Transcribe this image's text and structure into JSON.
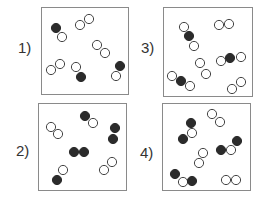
{
  "colors": {
    "dark_atom": "#2b2b2b",
    "light_atom_fill": "#ffffff",
    "light_atom_stroke": "#444444",
    "box_border": "#8a8a8a",
    "label": "#333333"
  },
  "atom_radius": 4.6,
  "panels": [
    {
      "label": "1)",
      "label_pos": [
        18,
        40
      ],
      "box": [
        41,
        7,
        88,
        88
      ],
      "atoms": [
        {
          "x": 56,
          "y": 28,
          "t": "dark"
        },
        {
          "x": 62,
          "y": 37,
          "t": "light"
        },
        {
          "x": 80,
          "y": 25,
          "t": "light"
        },
        {
          "x": 89,
          "y": 19,
          "t": "light"
        },
        {
          "x": 97,
          "y": 45,
          "t": "light"
        },
        {
          "x": 105,
          "y": 53,
          "t": "light"
        },
        {
          "x": 51,
          "y": 70,
          "t": "light"
        },
        {
          "x": 60,
          "y": 64,
          "t": "light"
        },
        {
          "x": 76,
          "y": 67,
          "t": "light"
        },
        {
          "x": 81,
          "y": 77,
          "t": "dark"
        },
        {
          "x": 120,
          "y": 66,
          "t": "dark"
        },
        {
          "x": 116,
          "y": 76,
          "t": "light"
        }
      ]
    },
    {
      "label": "2)",
      "label_pos": [
        16,
        143
      ],
      "box": [
        38,
        103,
        89,
        88
      ],
      "atoms": [
        {
          "x": 51,
          "y": 127,
          "t": "light"
        },
        {
          "x": 58,
          "y": 134,
          "t": "light"
        },
        {
          "x": 85,
          "y": 116,
          "t": "dark"
        },
        {
          "x": 93,
          "y": 123,
          "t": "light"
        },
        {
          "x": 115,
          "y": 128,
          "t": "dark"
        },
        {
          "x": 113,
          "y": 139,
          "t": "dark"
        },
        {
          "x": 74,
          "y": 152,
          "t": "dark"
        },
        {
          "x": 84,
          "y": 152,
          "t": "dark"
        },
        {
          "x": 63,
          "y": 170,
          "t": "light"
        },
        {
          "x": 57,
          "y": 180,
          "t": "dark"
        },
        {
          "x": 112,
          "y": 162,
          "t": "light"
        },
        {
          "x": 104,
          "y": 170,
          "t": "light"
        }
      ]
    },
    {
      "label": "3)",
      "label_pos": [
        141,
        40
      ],
      "box": [
        163,
        7,
        90,
        90
      ],
      "atoms": [
        {
          "x": 184,
          "y": 27,
          "t": "light"
        },
        {
          "x": 189,
          "y": 36,
          "t": "dark"
        },
        {
          "x": 194,
          "y": 46,
          "t": "light"
        },
        {
          "x": 219,
          "y": 25,
          "t": "light"
        },
        {
          "x": 229,
          "y": 24,
          "t": "light"
        },
        {
          "x": 200,
          "y": 63,
          "t": "light"
        },
        {
          "x": 206,
          "y": 74,
          "t": "light"
        },
        {
          "x": 221,
          "y": 61,
          "t": "light"
        },
        {
          "x": 230,
          "y": 58,
          "t": "dark"
        },
        {
          "x": 241,
          "y": 57,
          "t": "light"
        },
        {
          "x": 172,
          "y": 76,
          "t": "light"
        },
        {
          "x": 181,
          "y": 81,
          "t": "dark"
        },
        {
          "x": 190,
          "y": 86,
          "t": "light"
        },
        {
          "x": 232,
          "y": 89,
          "t": "light"
        },
        {
          "x": 241,
          "y": 82,
          "t": "light"
        }
      ]
    },
    {
      "label": "4)",
      "label_pos": [
        140,
        145
      ],
      "box": [
        162,
        103,
        89,
        88
      ],
      "atoms": [
        {
          "x": 212,
          "y": 114,
          "t": "light"
        },
        {
          "x": 220,
          "y": 122,
          "t": "light"
        },
        {
          "x": 191,
          "y": 123,
          "t": "dark"
        },
        {
          "x": 192,
          "y": 133,
          "t": "light"
        },
        {
          "x": 183,
          "y": 139,
          "t": "dark"
        },
        {
          "x": 237,
          "y": 141,
          "t": "dark"
        },
        {
          "x": 231,
          "y": 150,
          "t": "light"
        },
        {
          "x": 221,
          "y": 150,
          "t": "dark"
        },
        {
          "x": 203,
          "y": 153,
          "t": "light"
        },
        {
          "x": 199,
          "y": 163,
          "t": "light"
        },
        {
          "x": 175,
          "y": 174,
          "t": "dark"
        },
        {
          "x": 183,
          "y": 182,
          "t": "light"
        },
        {
          "x": 192,
          "y": 181,
          "t": "dark"
        },
        {
          "x": 226,
          "y": 180,
          "t": "light"
        },
        {
          "x": 236,
          "y": 180,
          "t": "light"
        }
      ]
    }
  ]
}
